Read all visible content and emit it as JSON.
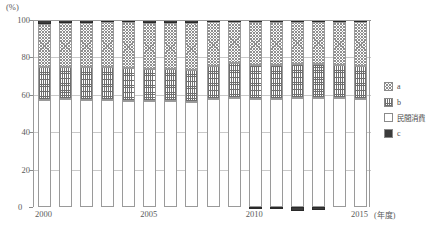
{
  "axis": {
    "unit_label": "(%)",
    "y_ticks": [
      100,
      80,
      60,
      40,
      20,
      0
    ],
    "y_min": 0,
    "y_max": 100,
    "x_ticks": [
      "2000",
      "2005",
      "2010",
      "2015"
    ],
    "x_unit": "(年度)",
    "zero_label": "0"
  },
  "legend": {
    "items": [
      {
        "label": "a",
        "pattern": "checker",
        "color": "#8f8f8f"
      },
      {
        "label": "b",
        "pattern": "grid",
        "color": "#6e6e6e"
      },
      {
        "label": "民間消費",
        "pattern": "white",
        "color": "#ffffff"
      },
      {
        "label": "c",
        "pattern": "solid",
        "color": "#3b3b3b"
      }
    ]
  },
  "chart_data": {
    "type": "bar",
    "title": "",
    "subtitle": "",
    "xlabel": "(年度)",
    "ylabel": "(%)",
    "ylim": [
      0,
      100
    ],
    "grid": true,
    "stacked": true,
    "percent_stacked": true,
    "legend_position": "right",
    "categories": [
      "2000",
      "2001",
      "2002",
      "2003",
      "2004",
      "2005",
      "2006",
      "2007",
      "2008",
      "2009",
      "2010",
      "2011",
      "2012",
      "2013",
      "2014",
      "2015"
    ],
    "series": [
      {
        "name": "民間消費",
        "pattern": "white",
        "values": [
          57.0,
          57.5,
          57.3,
          57.0,
          56.8,
          56.5,
          56.5,
          56.3,
          57.5,
          58.5,
          57.8,
          58.0,
          58.2,
          58.5,
          58.2,
          57.8
        ]
      },
      {
        "name": "b",
        "pattern": "grid",
        "values": [
          17.8,
          17.5,
          17.7,
          17.8,
          17.5,
          17.5,
          17.3,
          17.2,
          17.8,
          18.5,
          18.0,
          18.2,
          18.3,
          18.0,
          17.8,
          17.8
        ]
      },
      {
        "name": "a",
        "pattern": "checker",
        "values": [
          23.2,
          23.5,
          23.6,
          23.9,
          24.4,
          24.6,
          24.8,
          25.1,
          23.4,
          22.0,
          23.0,
          22.6,
          22.4,
          22.3,
          23.0,
          23.6
        ]
      },
      {
        "name": "c",
        "pattern": "solid",
        "values": [
          2.0,
          1.5,
          1.4,
          1.3,
          1.3,
          1.4,
          1.4,
          1.4,
          1.3,
          1.0,
          1.2,
          1.2,
          1.1,
          1.2,
          1.0,
          0.8
        ]
      }
    ],
    "negative_bars": {
      "name": "c-negative",
      "pattern": "solid",
      "values": [
        0,
        0,
        0,
        0,
        0,
        0,
        0,
        0,
        0,
        0,
        -1.1,
        -1.3,
        -2.2,
        -1.5,
        0,
        0
      ]
    }
  },
  "footnote": ""
}
